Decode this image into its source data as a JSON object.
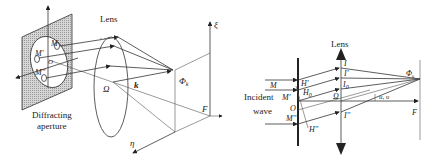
{
  "left_figure": {
    "lens_label": "Lens",
    "aperture_label_line1": "Diffracting",
    "aperture_label_line2": "aperture",
    "points": {
      "M_prime": "M'",
      "M_double_prime": "M''",
      "M": "M",
      "O": "O"
    },
    "omega": "Ω",
    "k": "k",
    "phi": "Φ",
    "phi_sub": "k",
    "F": "F",
    "xi": "ξ",
    "eta": "η"
  },
  "right_figure": {
    "lens_label": "Lens",
    "incident_line1": "Incident",
    "incident_line2": "wave",
    "M": "M",
    "M_prime": "M'",
    "O": "O",
    "M_double_prime": "M''",
    "H_prime": "H'",
    "H0": "H",
    "H0_sub": "0",
    "H_double_prime": "H''",
    "I": "I",
    "I_prime": "I'",
    "I0": "I",
    "I0_sub": "0",
    "omega": "Ω",
    "I_double_prime": "I''",
    "phi": "Φ",
    "phi_sub": "k",
    "angles": "u, υ",
    "F": "F"
  },
  "colors": {
    "stroke": "#333333",
    "aperture_fill": "#c8c8c8",
    "background": "#ffffff"
  }
}
